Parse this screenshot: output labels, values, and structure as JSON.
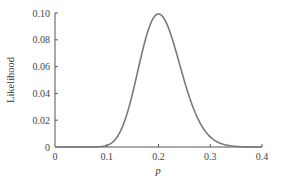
{
  "chart_data": {
    "type": "line",
    "title": "",
    "xlabel": "p",
    "ylabel": "Likelihood",
    "xlim": [
      0,
      0.4
    ],
    "ylim": [
      0,
      0.1
    ],
    "xticks": [
      0,
      0.1,
      0.2,
      0.3,
      0.4
    ],
    "xtick_labels": [
      "0",
      "0.1",
      "0.2",
      "0.3",
      "0.4"
    ],
    "yticks": [
      0,
      0.02,
      0.04,
      0.06,
      0.08,
      0.1
    ],
    "ytick_labels": [
      "0",
      "0.02",
      "0.04",
      "0.06",
      "0.08",
      "0.10"
    ],
    "grid": false,
    "legend": null,
    "series": [
      {
        "name": "Likelihood",
        "color": "#7a7a7a",
        "x": [
          0.0,
          0.02,
          0.04,
          0.06,
          0.08,
          0.1,
          0.11,
          0.12,
          0.13,
          0.14,
          0.15,
          0.16,
          0.17,
          0.18,
          0.19,
          0.2,
          0.21,
          0.22,
          0.23,
          0.24,
          0.25,
          0.26,
          0.27,
          0.28,
          0.29,
          0.3,
          0.31,
          0.32,
          0.33,
          0.34,
          0.35,
          0.36,
          0.38,
          0.4
        ],
        "values": [
          0.0,
          0.0,
          0.0,
          1e-05,
          0.0002,
          0.0012,
          0.0031,
          0.0068,
          0.0128,
          0.0211,
          0.0308,
          0.0412,
          0.0587,
          0.0755,
          0.0911,
          0.0993,
          0.0966,
          0.0886,
          0.0768,
          0.0632,
          0.0493,
          0.0365,
          0.0258,
          0.0174,
          0.0112,
          0.0069,
          0.0041,
          0.0023,
          0.0012,
          0.0006,
          0.0003,
          0.00015,
          3e-05,
          1e-05
        ]
      }
    ]
  },
  "axes": {
    "ylabel": "Likelihood",
    "xlabel": "p"
  }
}
